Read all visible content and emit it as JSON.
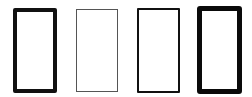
{
  "figure": {
    "background": "#ffffff",
    "rectangles": [
      {
        "id": "rect-1",
        "left": 13,
        "top": 8,
        "width": 44,
        "height": 85,
        "border_width": 4,
        "border_color": "#111111",
        "radius": 2
      },
      {
        "id": "rect-2",
        "left": 76,
        "top": 9,
        "width": 42,
        "height": 83,
        "border_width": 1,
        "border_color": "#555555",
        "radius": 0
      },
      {
        "id": "rect-3",
        "left": 137,
        "top": 8,
        "width": 43,
        "height": 85,
        "border_width": 2,
        "border_color": "#111111",
        "radius": 1
      },
      {
        "id": "rect-4",
        "left": 197,
        "top": 6,
        "width": 45,
        "height": 88,
        "border_width": 5,
        "border_color": "#0a0a0a",
        "radius": 3
      }
    ]
  }
}
